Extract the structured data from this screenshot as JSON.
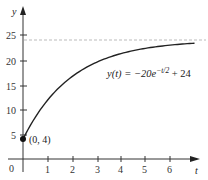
{
  "chart_data": {
    "type": "line",
    "title": "",
    "xlabel": "t",
    "ylabel": "y",
    "xlim": [
      0,
      7
    ],
    "ylim": [
      0,
      28
    ],
    "x_ticks": [
      1,
      2,
      3,
      4,
      5,
      6
    ],
    "y_ticks": [
      5,
      10,
      15,
      20,
      25
    ],
    "origin_label": "0",
    "grid": false,
    "legend": null,
    "series": [
      {
        "name": "y(t) = −20e^(−t/2) + 24",
        "function": "-20*exp(-t/2)+24",
        "x": [
          0,
          0.5,
          1,
          1.5,
          2,
          2.5,
          3,
          3.5,
          4,
          4.5,
          5,
          5.5,
          6,
          6.5,
          7
        ],
        "values": [
          4.0,
          8.42,
          11.87,
          14.55,
          16.64,
          18.27,
          19.54,
          20.52,
          21.29,
          21.89,
          22.36,
          22.72,
          23.0,
          23.22,
          23.4
        ]
      }
    ],
    "asymptote": {
      "y": 24,
      "style": "dashed"
    },
    "annotations": [
      {
        "text": "(0, 4)",
        "x": 0,
        "y": 4,
        "marker": "filled-circle"
      },
      {
        "text": "y(t) = −20e^{−t/2} + 24",
        "position": "right of curve"
      }
    ]
  },
  "labels": {
    "y_axis": "y",
    "x_axis": "t",
    "origin": "0",
    "point": "(0, 4)",
    "equation_lhs": "y(t) = −20e",
    "equation_exp": "−t/2",
    "equation_rhs": " + 24",
    "x_tick_labels": [
      "1",
      "2",
      "3",
      "4",
      "5",
      "6"
    ],
    "y_tick_labels": [
      "5",
      "10",
      "15",
      "20",
      "25"
    ]
  },
  "colors": {
    "axis": "#333333",
    "curve": "#222222",
    "asymptote": "#bbbbbb"
  }
}
